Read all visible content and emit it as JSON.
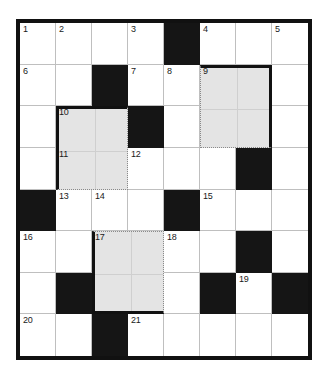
{
  "puzzle": {
    "title": "Crossword Grid",
    "rows": 8,
    "cols": 8,
    "cell_size": 36.5,
    "colors": {
      "block": "#151515",
      "shade": "#e4e4e4",
      "grid_line": "#bfbfbf",
      "frame": "#111111",
      "paper": "#ffffff"
    },
    "cells": [
      {
        "row": 0,
        "col": 0,
        "type": "open",
        "number": "1"
      },
      {
        "row": 0,
        "col": 1,
        "type": "open",
        "number": "2"
      },
      {
        "row": 0,
        "col": 2,
        "type": "open",
        "number": ""
      },
      {
        "row": 0,
        "col": 3,
        "type": "open",
        "number": "3"
      },
      {
        "row": 0,
        "col": 4,
        "type": "block",
        "number": ""
      },
      {
        "row": 0,
        "col": 5,
        "type": "open",
        "number": "4"
      },
      {
        "row": 0,
        "col": 6,
        "type": "open",
        "number": ""
      },
      {
        "row": 0,
        "col": 7,
        "type": "open",
        "number": "5"
      },
      {
        "row": 1,
        "col": 0,
        "type": "open",
        "number": "6"
      },
      {
        "row": 1,
        "col": 1,
        "type": "open",
        "number": ""
      },
      {
        "row": 1,
        "col": 2,
        "type": "block",
        "number": ""
      },
      {
        "row": 1,
        "col": 3,
        "type": "open",
        "number": "7"
      },
      {
        "row": 1,
        "col": 4,
        "type": "open",
        "number": "8"
      },
      {
        "row": 1,
        "col": 5,
        "type": "shaded",
        "number": "9"
      },
      {
        "row": 1,
        "col": 6,
        "type": "shaded",
        "number": ""
      },
      {
        "row": 1,
        "col": 7,
        "type": "open",
        "number": ""
      },
      {
        "row": 2,
        "col": 0,
        "type": "open",
        "number": ""
      },
      {
        "row": 2,
        "col": 1,
        "type": "shaded",
        "number": "10"
      },
      {
        "row": 2,
        "col": 2,
        "type": "shaded",
        "number": ""
      },
      {
        "row": 2,
        "col": 3,
        "type": "block",
        "number": ""
      },
      {
        "row": 2,
        "col": 4,
        "type": "open",
        "number": ""
      },
      {
        "row": 2,
        "col": 5,
        "type": "shaded",
        "number": ""
      },
      {
        "row": 2,
        "col": 6,
        "type": "shaded",
        "number": ""
      },
      {
        "row": 2,
        "col": 7,
        "type": "open",
        "number": ""
      },
      {
        "row": 3,
        "col": 0,
        "type": "open",
        "number": ""
      },
      {
        "row": 3,
        "col": 1,
        "type": "shaded",
        "number": "11"
      },
      {
        "row": 3,
        "col": 2,
        "type": "shaded",
        "number": ""
      },
      {
        "row": 3,
        "col": 3,
        "type": "open",
        "number": "12"
      },
      {
        "row": 3,
        "col": 4,
        "type": "open",
        "number": ""
      },
      {
        "row": 3,
        "col": 5,
        "type": "open",
        "number": ""
      },
      {
        "row": 3,
        "col": 6,
        "type": "block",
        "number": ""
      },
      {
        "row": 3,
        "col": 7,
        "type": "open",
        "number": ""
      },
      {
        "row": 4,
        "col": 0,
        "type": "block",
        "number": ""
      },
      {
        "row": 4,
        "col": 1,
        "type": "open",
        "number": "13"
      },
      {
        "row": 4,
        "col": 2,
        "type": "open",
        "number": "14"
      },
      {
        "row": 4,
        "col": 3,
        "type": "open",
        "number": ""
      },
      {
        "row": 4,
        "col": 4,
        "type": "block",
        "number": ""
      },
      {
        "row": 4,
        "col": 5,
        "type": "open",
        "number": "15"
      },
      {
        "row": 4,
        "col": 6,
        "type": "open",
        "number": ""
      },
      {
        "row": 4,
        "col": 7,
        "type": "open",
        "number": ""
      },
      {
        "row": 5,
        "col": 0,
        "type": "open",
        "number": "16"
      },
      {
        "row": 5,
        "col": 1,
        "type": "open",
        "number": ""
      },
      {
        "row": 5,
        "col": 2,
        "type": "shaded",
        "number": "17"
      },
      {
        "row": 5,
        "col": 3,
        "type": "shaded",
        "number": ""
      },
      {
        "row": 5,
        "col": 4,
        "type": "open",
        "number": "18"
      },
      {
        "row": 5,
        "col": 5,
        "type": "open",
        "number": ""
      },
      {
        "row": 5,
        "col": 6,
        "type": "block",
        "number": ""
      },
      {
        "row": 5,
        "col": 7,
        "type": "open",
        "number": ""
      },
      {
        "row": 6,
        "col": 0,
        "type": "open",
        "number": ""
      },
      {
        "row": 6,
        "col": 1,
        "type": "block",
        "number": ""
      },
      {
        "row": 6,
        "col": 2,
        "type": "shaded",
        "number": ""
      },
      {
        "row": 6,
        "col": 3,
        "type": "shaded",
        "number": ""
      },
      {
        "row": 6,
        "col": 4,
        "type": "open",
        "number": ""
      },
      {
        "row": 6,
        "col": 5,
        "type": "block",
        "number": ""
      },
      {
        "row": 6,
        "col": 6,
        "type": "open",
        "number": "19"
      },
      {
        "row": 6,
        "col": 7,
        "type": "block",
        "number": ""
      },
      {
        "row": 7,
        "col": 0,
        "type": "open",
        "number": "20"
      },
      {
        "row": 7,
        "col": 1,
        "type": "open",
        "number": ""
      },
      {
        "row": 7,
        "col": 2,
        "type": "block",
        "number": ""
      },
      {
        "row": 7,
        "col": 3,
        "type": "open",
        "number": "21"
      },
      {
        "row": 7,
        "col": 4,
        "type": "open",
        "number": ""
      },
      {
        "row": 7,
        "col": 5,
        "type": "open",
        "number": ""
      },
      {
        "row": 7,
        "col": 6,
        "type": "open",
        "number": ""
      },
      {
        "row": 7,
        "col": 7,
        "type": "open",
        "number": ""
      }
    ],
    "shaded_regions": [
      {
        "id": "region-9",
        "start_number": "9",
        "row": 1,
        "col": 5,
        "width": 2,
        "height": 2,
        "style": "style-a"
      },
      {
        "id": "region-10",
        "start_number": "10",
        "row": 2,
        "col": 1,
        "width": 2,
        "height": 2,
        "style": "style-b"
      },
      {
        "id": "region-17",
        "start_number": "17",
        "row": 5,
        "col": 2,
        "width": 2,
        "height": 2,
        "style": "style-c"
      }
    ],
    "region_numbers": [
      {
        "region": "region-9",
        "row": 1,
        "col": 5,
        "number": "9"
      },
      {
        "region": "region-10",
        "row": 2,
        "col": 1,
        "number": "10"
      },
      {
        "region": "region-10",
        "row": 3,
        "col": 1,
        "number": "11"
      },
      {
        "region": "region-17",
        "row": 5,
        "col": 2,
        "number": "17"
      }
    ]
  }
}
